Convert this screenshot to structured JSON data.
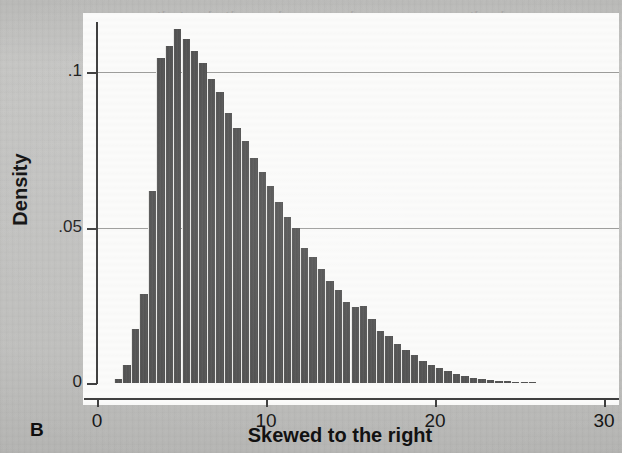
{
  "figure": {
    "panel_label": "B",
    "background_color": "#fbfbfa",
    "page_color": "#bfbfbd",
    "bar_color": "#4d4d4d",
    "axis_color": "#3b3b3b",
    "grid_color": "#9a9a98"
  },
  "ghost_text": {
    "lines": [
      "the disease are normal may not be applied to indi-",
      "th the same disease. The indirect standardization",
      "imple sampling leads to the weights that have",
      "ribed the cross-summary statistics available in",
      "the sample and input from each of the levels.",
      "factors that are appropriate to the category of data",
      "ned by cross-product rate estimation comparing",
      "the order is to represent the model sampling",
      "nts of density variables and the proportions"
    ]
  },
  "chart_data": {
    "type": "bar",
    "title": "",
    "subtitle": "",
    "xlabel": "Skewed to the right",
    "ylabel": "Density",
    "panel": "B",
    "grid": true,
    "grid_axis": "y",
    "legend": false,
    "xlim": [
      0,
      30
    ],
    "ylim": [
      0,
      0.1225
    ],
    "xticks": [
      0,
      10,
      20,
      30
    ],
    "xticklabels": [
      "0",
      "10",
      "20",
      "30"
    ],
    "yticks": [
      0,
      0.05,
      0.1
    ],
    "yticklabels": [
      "0",
      ".05",
      ".1"
    ],
    "bin_width": 0.5,
    "x": [
      1.25,
      1.75,
      2.25,
      2.75,
      3.25,
      3.75,
      4.25,
      4.75,
      5.25,
      5.75,
      6.25,
      6.75,
      7.25,
      7.75,
      8.25,
      8.75,
      9.25,
      9.75,
      10.25,
      10.75,
      11.25,
      11.75,
      12.25,
      12.75,
      13.25,
      13.75,
      14.25,
      14.75,
      15.25,
      15.75,
      16.25,
      16.75,
      17.25,
      17.75,
      18.25,
      18.75,
      19.25,
      19.75,
      20.25,
      20.75,
      21.25,
      21.75,
      22.25,
      22.75,
      23.25,
      23.75,
      24.25,
      24.75,
      25.25,
      25.75
    ],
    "values": [
      0.0013,
      0.0058,
      0.0174,
      0.0285,
      0.0617,
      0.1045,
      0.1085,
      0.1139,
      0.1105,
      0.1068,
      0.1029,
      0.0977,
      0.0935,
      0.0868,
      0.0819,
      0.0777,
      0.0722,
      0.0677,
      0.0632,
      0.0581,
      0.0535,
      0.05,
      0.0435,
      0.0406,
      0.0365,
      0.0329,
      0.03,
      0.0261,
      0.0245,
      0.0248,
      0.0206,
      0.0168,
      0.0152,
      0.0126,
      0.0106,
      0.009,
      0.0071,
      0.0058,
      0.0048,
      0.0039,
      0.0029,
      0.0023,
      0.0016,
      0.0013,
      0.001,
      0.0006,
      0.0006,
      0.0003,
      0.0003,
      0.0002
    ],
    "geometry": {
      "plot_left_px": 97,
      "plot_right_px": 604,
      "baseline_y_px": 383,
      "y_005_px": 228,
      "y_01_px": 72
    }
  }
}
